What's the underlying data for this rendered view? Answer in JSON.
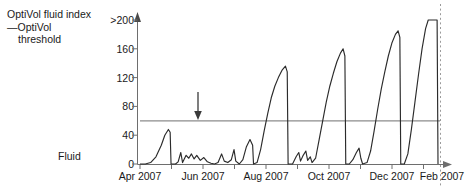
{
  "legend": {
    "series_label": "OptiVol fluid index",
    "threshold_label_line1": "—OptiVol",
    "threshold_label_line2": "threshold"
  },
  "axis": {
    "fluid_label": "Fluid",
    "y_ticks": [
      ">200",
      "160",
      "120",
      "80",
      "40",
      "0"
    ],
    "x_ticks": [
      "Apr 2007",
      "Jun 2007",
      "Aug 2007",
      "Oct 2007",
      "Dec 2007",
      "Feb 2007"
    ]
  },
  "colors": {
    "curve": "#2b2b2b",
    "threshold": "#8c8c8c",
    "axis": "#6e6e6e",
    "arrow": "#3a3a3a",
    "dotted": "#9a9a9a"
  },
  "chart_data": {
    "type": "line",
    "title": "",
    "xlabel": "",
    "ylabel": "OptiVol fluid index",
    "ylim": [
      0,
      200
    ],
    "ytick_values": [
      0,
      40,
      80,
      120,
      160,
      200
    ],
    "ytick_labels": [
      "0",
      "40",
      "80",
      "120",
      "160",
      ">200"
    ],
    "xtick_labels": [
      "Apr 2007",
      "Jun 2007",
      "Aug 2007",
      "Oct 2007",
      "Dec 2007",
      "Feb 2007"
    ],
    "grid": false,
    "legend_position": "top-left-outside",
    "threshold_value": 60,
    "annotations": [
      {
        "type": "arrow",
        "direction": "down",
        "x_label": "mid-May 2007",
        "points_to_value": 60
      },
      {
        "type": "dotted-vertical-line",
        "x_label": "end of record"
      }
    ],
    "series": [
      {
        "name": "OptiVol fluid index",
        "points": [
          [
            0,
            0
          ],
          [
            6,
            0
          ],
          [
            12,
            2
          ],
          [
            18,
            10
          ],
          [
            24,
            26
          ],
          [
            28,
            40
          ],
          [
            32,
            48
          ],
          [
            34,
            44
          ],
          [
            35,
            0
          ],
          [
            40,
            0
          ],
          [
            43,
            3
          ],
          [
            46,
            16
          ],
          [
            48,
            2
          ],
          [
            52,
            12
          ],
          [
            55,
            8
          ],
          [
            58,
            14
          ],
          [
            61,
            7
          ],
          [
            64,
            12
          ],
          [
            68,
            5
          ],
          [
            72,
            9
          ],
          [
            76,
            3
          ],
          [
            80,
            1
          ],
          [
            84,
            0
          ],
          [
            88,
            2
          ],
          [
            92,
            14
          ],
          [
            95,
            4
          ],
          [
            99,
            2
          ],
          [
            103,
            6
          ],
          [
            106,
            20
          ],
          [
            108,
            4
          ],
          [
            112,
            0
          ],
          [
            116,
            6
          ],
          [
            120,
            24
          ],
          [
            124,
            34
          ],
          [
            127,
            26
          ],
          [
            128,
            0
          ],
          [
            132,
            2
          ],
          [
            136,
            20
          ],
          [
            140,
            46
          ],
          [
            144,
            70
          ],
          [
            148,
            92
          ],
          [
            152,
            108
          ],
          [
            156,
            120
          ],
          [
            160,
            130
          ],
          [
            164,
            136
          ],
          [
            166,
            128
          ],
          [
            167,
            0
          ],
          [
            172,
            0
          ],
          [
            176,
            10
          ],
          [
            179,
            16
          ],
          [
            181,
            4
          ],
          [
            184,
            12
          ],
          [
            187,
            18
          ],
          [
            189,
            5
          ],
          [
            192,
            10
          ],
          [
            194,
            2
          ],
          [
            198,
            8
          ],
          [
            202,
            34
          ],
          [
            206,
            60
          ],
          [
            210,
            86
          ],
          [
            214,
            108
          ],
          [
            218,
            126
          ],
          [
            222,
            142
          ],
          [
            226,
            154
          ],
          [
            229,
            160
          ],
          [
            231,
            150
          ],
          [
            232,
            0
          ],
          [
            236,
            0
          ],
          [
            240,
            6
          ],
          [
            244,
            16
          ],
          [
            247,
            22
          ],
          [
            249,
            8
          ],
          [
            251,
            0
          ],
          [
            256,
            2
          ],
          [
            260,
            18
          ],
          [
            264,
            46
          ],
          [
            268,
            76
          ],
          [
            272,
            104
          ],
          [
            276,
            128
          ],
          [
            280,
            150
          ],
          [
            284,
            168
          ],
          [
            288,
            180
          ],
          [
            291,
            185
          ],
          [
            293,
            176
          ],
          [
            294,
            0
          ],
          [
            298,
            0
          ],
          [
            302,
            14
          ],
          [
            306,
            48
          ],
          [
            310,
            86
          ],
          [
            314,
            124
          ],
          [
            318,
            160
          ],
          [
            322,
            188
          ],
          [
            325,
            200
          ],
          [
            334,
            200
          ],
          [
            335,
            200
          ],
          [
            336,
            0
          ]
        ]
      }
    ]
  }
}
